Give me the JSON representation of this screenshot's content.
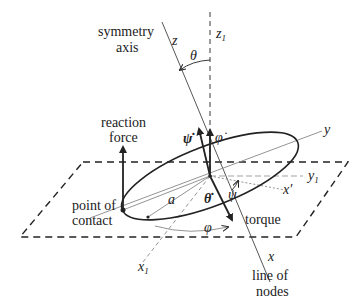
{
  "diagram": {
    "colors": {
      "stroke": "#222222",
      "light_line": "#888888",
      "background": "#ffffff"
    },
    "labels": {
      "symmetry_axis_1": "symmetry",
      "symmetry_axis_2": "axis",
      "z": "z",
      "z1_base": "z",
      "z1_sub": "1",
      "theta": "θ",
      "reaction_force_1": "reaction",
      "reaction_force_2": "force",
      "psi_dot": "ψ̇",
      "phi_dot": "φ̇",
      "y": "y",
      "y1_base": "y",
      "y1_sub": "1",
      "psi": "ψ",
      "x_prime": "x′",
      "theta_dot": "θ̇",
      "a": "a",
      "torque": "torque",
      "point_of_contact_1": "point of",
      "point_of_contact_2": "contact",
      "phi": "φ",
      "x": "x",
      "x1_base": "x",
      "x1_sub": "1",
      "line_of_nodes_1": "line of",
      "line_of_nodes_2": "nodes"
    }
  }
}
